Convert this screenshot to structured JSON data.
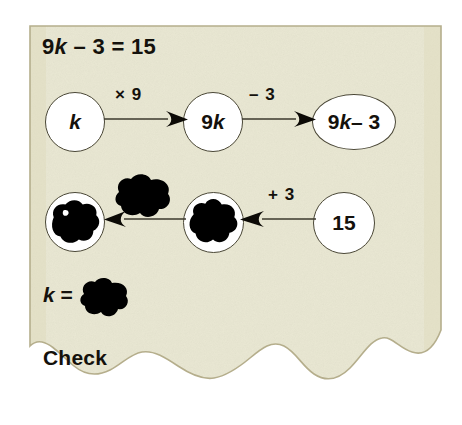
{
  "worksheet": {
    "equation": {
      "prefix": "9",
      "variable": "k",
      "suffix": " – 3 = 15"
    },
    "answer_line": {
      "variable": "k",
      "equals": " = "
    },
    "check_label": "Check",
    "paper_color": "#e9e7d2",
    "paper_edge_color": "#b5ae8c",
    "ink_color": "#14110c",
    "node_fill": "#ffffff",
    "node_stroke": "#4a4736"
  },
  "flow": {
    "top_row": {
      "nodes": [
        {
          "id": "start",
          "label_prefix": "",
          "label_variable": "k",
          "label_suffix": "",
          "shape": "circle",
          "hidden": false
        },
        {
          "id": "times9",
          "label_prefix": "9",
          "label_variable": "k",
          "label_suffix": "",
          "shape": "circle",
          "hidden": false
        },
        {
          "id": "minus3",
          "label_prefix": "9",
          "label_variable": "k",
          "label_suffix": " – 3",
          "shape": "ellipse",
          "hidden": false
        }
      ],
      "operations": [
        {
          "id": "op-multiply",
          "label": "× 9",
          "direction": "right"
        },
        {
          "id": "op-subtract",
          "label": "– 3",
          "direction": "right"
        }
      ]
    },
    "bottom_row": {
      "nodes": [
        {
          "id": "undo-result",
          "label": "",
          "shape": "circle",
          "hidden": true,
          "hidden_by": "ink-blot"
        },
        {
          "id": "undo-add",
          "label": "",
          "shape": "circle",
          "hidden": true,
          "hidden_by": "ink-blot"
        },
        {
          "id": "given-15",
          "label": "15",
          "shape": "circle",
          "hidden": false
        }
      ],
      "operations": [
        {
          "id": "op-undo-divide",
          "label": "",
          "direction": "left",
          "hidden": true,
          "hidden_by": "ink-blot"
        },
        {
          "id": "op-add",
          "label": "+ 3",
          "direction": "left",
          "hidden": false
        }
      ]
    }
  },
  "blots": {
    "count": 5,
    "color": "#000000",
    "note": "ink blots cover the answers"
  }
}
